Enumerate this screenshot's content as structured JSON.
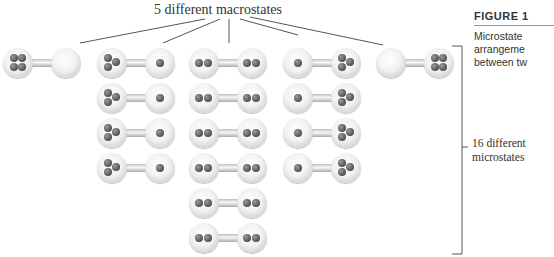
{
  "title": "5 different macrostates",
  "bracket_label_line1": "16 different",
  "bracket_label_line2": "microstates",
  "caption": {
    "figure_label": "FIGURE 1",
    "line1": "Microstate",
    "line2": "arrangeme",
    "line3": "between tw"
  },
  "colors": {
    "bulb": "#eeeeee",
    "particle": "#555555",
    "line": "#555555"
  },
  "macrostates": [
    {
      "left_particles": 4,
      "right_particles": 0,
      "microstate_count": 1
    },
    {
      "left_particles": 3,
      "right_particles": 1,
      "microstate_count": 4
    },
    {
      "left_particles": 2,
      "right_particles": 2,
      "microstate_count": 6
    },
    {
      "left_particles": 1,
      "right_particles": 3,
      "microstate_count": 4
    },
    {
      "left_particles": 0,
      "right_particles": 4,
      "microstate_count": 1
    }
  ],
  "total_microstates": 16
}
